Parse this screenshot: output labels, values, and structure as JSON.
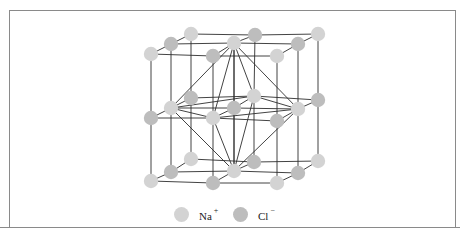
{
  "figure": {
    "colors": {
      "na": "#d3d3d3",
      "cl": "#bdbdbd",
      "bond": "#2e2e2e",
      "frame": "#8a8a8a"
    }
  },
  "legend": {
    "items": [
      {
        "ion": "Na",
        "charge": "+",
        "color": "#d3d3d3"
      },
      {
        "ion": "Cl",
        "charge": "−",
        "color": "#bdbdbd"
      }
    ]
  },
  "atoms": [
    {
      "x": 191,
      "y": 34,
      "t": "na"
    },
    {
      "x": 255,
      "y": 35,
      "t": "cl"
    },
    {
      "x": 318,
      "y": 34,
      "t": "na"
    },
    {
      "x": 171,
      "y": 44,
      "t": "cl"
    },
    {
      "x": 234,
      "y": 43,
      "t": "na"
    },
    {
      "x": 298,
      "y": 44,
      "t": "cl"
    },
    {
      "x": 151,
      "y": 54,
      "t": "na"
    },
    {
      "x": 213,
      "y": 56,
      "t": "cl"
    },
    {
      "x": 277,
      "y": 56,
      "t": "na"
    },
    {
      "x": 191,
      "y": 98,
      "t": "cl"
    },
    {
      "x": 254,
      "y": 96,
      "t": "na"
    },
    {
      "x": 318,
      "y": 100,
      "t": "cl"
    },
    {
      "x": 171,
      "y": 108,
      "t": "na"
    },
    {
      "x": 234,
      "y": 108,
      "t": "cl"
    },
    {
      "x": 298,
      "y": 109,
      "t": "na"
    },
    {
      "x": 151,
      "y": 118,
      "t": "cl"
    },
    {
      "x": 213,
      "y": 118,
      "t": "na"
    },
    {
      "x": 277,
      "y": 121,
      "t": "cl"
    },
    {
      "x": 191,
      "y": 159,
      "t": "na"
    },
    {
      "x": 254,
      "y": 162,
      "t": "cl"
    },
    {
      "x": 318,
      "y": 161,
      "t": "na"
    },
    {
      "x": 171,
      "y": 172,
      "t": "cl"
    },
    {
      "x": 234,
      "y": 171,
      "t": "na"
    },
    {
      "x": 298,
      "y": 173,
      "t": "cl"
    },
    {
      "x": 151,
      "y": 181,
      "t": "na"
    },
    {
      "x": 213,
      "y": 183,
      "t": "cl"
    },
    {
      "x": 277,
      "y": 183,
      "t": "na"
    }
  ]
}
